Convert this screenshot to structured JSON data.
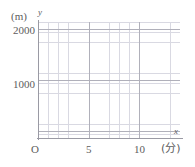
{
  "figure": {
    "kind": "blank-coordinate-grid",
    "background_color": "#ffffff",
    "minor_grid_color": "#d9d9e2",
    "major_grid_color": "#b0b0ba",
    "axis_color": "#9a9aa4",
    "text_color": "#5d5d5d"
  },
  "axes": {
    "y": {
      "name": "y",
      "unit_label": "(m)",
      "tick_labels": [
        "2000",
        "1000"
      ]
    },
    "x": {
      "name": "x",
      "unit_label": "(分)",
      "origin_label": "O",
      "tick_labels": [
        "5",
        "10"
      ]
    }
  },
  "chart_data": {
    "type": "line",
    "title": "",
    "xlabel": "(分)",
    "ylabel": "(m)",
    "x_axis_name": "x",
    "y_axis_name": "y",
    "origin_label": "O",
    "xlim": [
      0,
      14
    ],
    "ylim": [
      0,
      2200
    ],
    "x_ticks": [
      0,
      5,
      10
    ],
    "x_tick_labels": [
      "O",
      "5",
      "10"
    ],
    "y_ticks": [
      1000,
      2000
    ],
    "y_tick_labels": [
      "1000",
      "2000"
    ],
    "x_minor_step": 1,
    "y_minor_step": 200,
    "x_major_step": 5,
    "y_major_step": 1000,
    "grid": true,
    "minor_grid": true,
    "legend": false,
    "series": [],
    "values": [],
    "note": "Empty graph paper; no data series plotted."
  }
}
